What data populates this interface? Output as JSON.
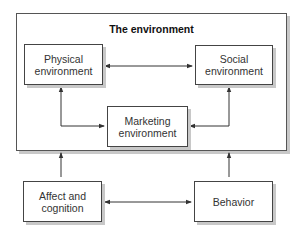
{
  "diagram": {
    "title": "The environment",
    "nodes": {
      "physical": "Physical\nenvironment",
      "social": "Social\nenvironment",
      "marketing": "Marketing\nenvironment",
      "affect": "Affect and\ncognition",
      "behavior": "Behavior"
    },
    "edges": [
      {
        "from": "Physical environment",
        "to": "Social environment",
        "type": "bidirectional"
      },
      {
        "from": "Physical environment",
        "to": "Marketing environment",
        "type": "bidirectional"
      },
      {
        "from": "Social environment",
        "to": "Marketing environment",
        "type": "bidirectional"
      },
      {
        "from": "Affect and cognition",
        "to": "Behavior",
        "type": "bidirectional"
      },
      {
        "from": "Affect and cognition",
        "to": "The environment",
        "type": "directed"
      },
      {
        "from": "Behavior",
        "to": "The environment",
        "type": "directed"
      }
    ],
    "colors": {
      "line": "#333333",
      "shadow": "#c8c8c8"
    }
  }
}
